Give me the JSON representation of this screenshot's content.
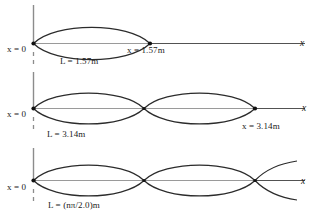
{
  "figure": {
    "axis_label": "x",
    "panels": [
      {
        "id": "panel-n1",
        "origin_label": "x = 0",
        "length_label": "L = 1.57m",
        "end_label": "x = 1.57m",
        "axis_label": "x",
        "mode_n": 1,
        "lobes": 1
      },
      {
        "id": "panel-n2",
        "origin_label": "x = 0",
        "length_label": "L = 3.14m",
        "end_label": "x = 3.14m",
        "axis_label": "x",
        "mode_n": 2,
        "lobes": 2
      },
      {
        "id": "panel-n-general",
        "origin_label": "x = 0",
        "length_label": "L = (nπ/2.0)m",
        "end_label": "",
        "axis_label": "x",
        "mode_n": "n",
        "lobes": 3
      }
    ],
    "colors": {
      "curve": "#2b2b2b",
      "axis": "#8c8c8c",
      "baseline": "#3a3a3a",
      "node_dot": "#111111",
      "text": "#1a1a1a",
      "background": "#ffffff"
    }
  }
}
